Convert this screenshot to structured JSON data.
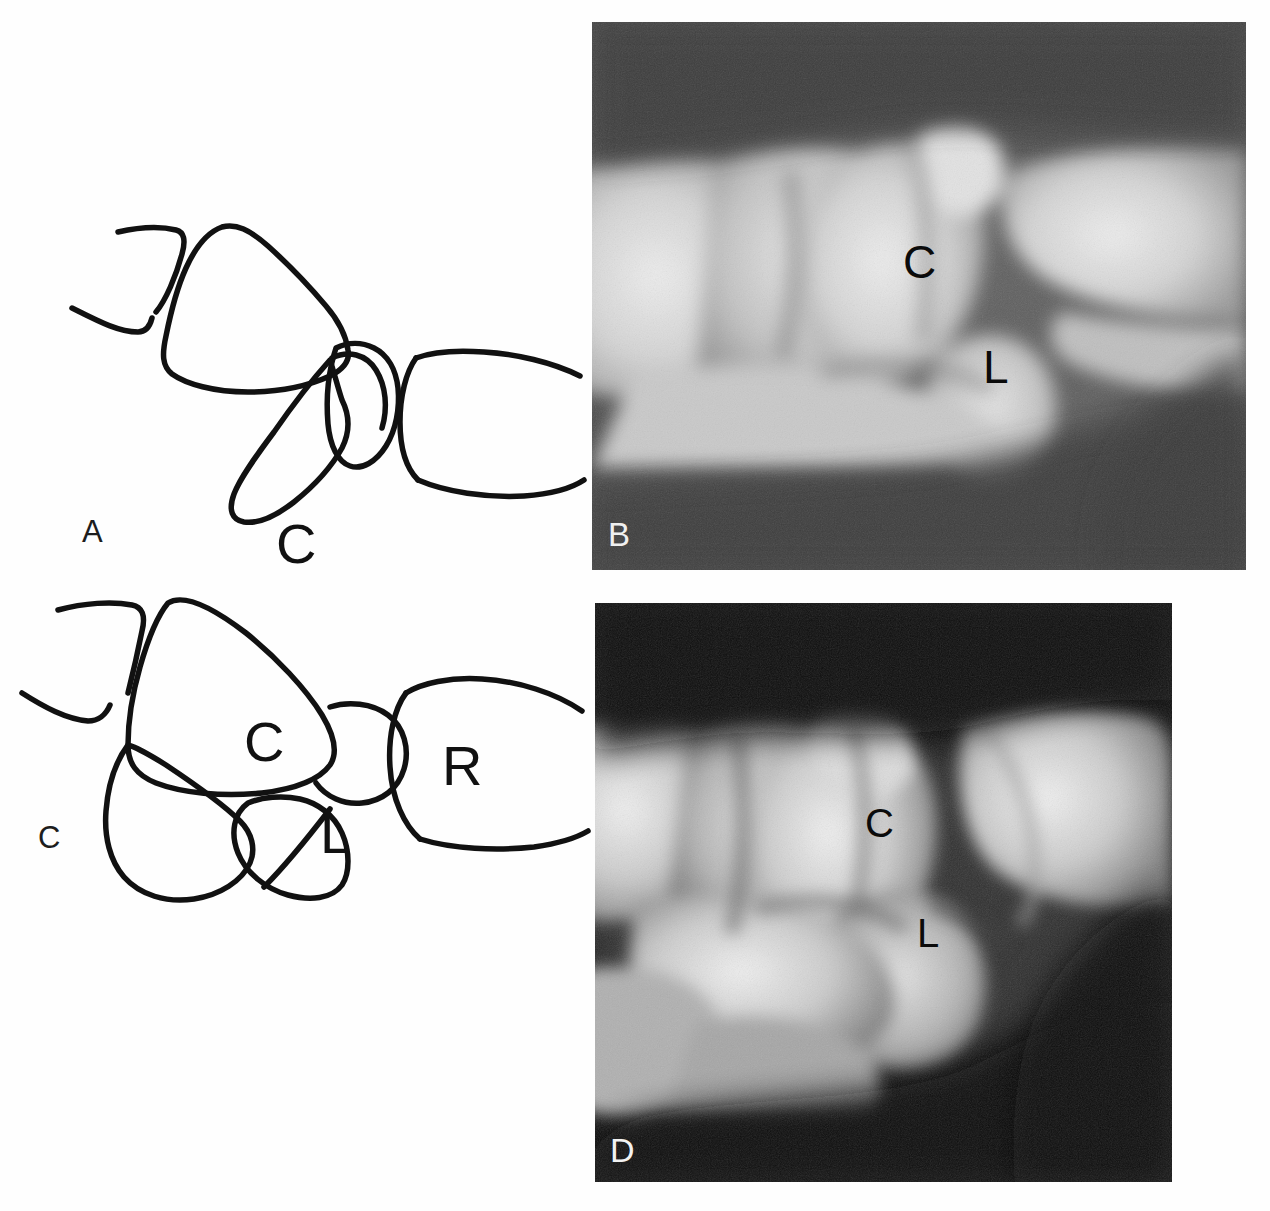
{
  "figure": {
    "background_color": "#ffffff",
    "panel_count": 4,
    "layout": "2x2 grid; left column line drawings (A, C), right column radiographs (B, D)"
  },
  "panels": [
    {
      "id": "A",
      "letter": "A",
      "type": "line-drawing",
      "letter_color": "#1d1d1d",
      "description": "Lateral line drawing of the wrist showing dorsal intercalated segment instability (DISI): lunate tilted dorsally, capitate displaced dorsally.",
      "stroke_color": "#111111",
      "bone_labels": [
        {
          "text": "C",
          "name": "capitate",
          "x": 300,
          "y": 362
        },
        {
          "text": "L",
          "name": "lunate",
          "x": 380,
          "y": 432
        },
        {
          "text": "R",
          "name": "radius",
          "x": 456,
          "y": 432
        }
      ]
    },
    {
      "id": "B",
      "letter": "B",
      "type": "radiograph",
      "letter_color": "#f0f0f0",
      "description": "Lateral radiograph of the wrist corresponding to drawing A; background mid-gray, bones bright.",
      "background_color": "#4a4a4a",
      "bone_labels": [
        {
          "text": "C",
          "name": "capitate",
          "x": 925,
          "y": 262
        },
        {
          "text": "L",
          "name": "lunate",
          "x": 1005,
          "y": 368
        }
      ]
    },
    {
      "id": "C",
      "letter": "C",
      "type": "line-drawing",
      "letter_color": "#1d1d1d",
      "description": "Lateral line drawing of the wrist showing volar intercalated segment instability (VISI): lunate tilted volarly.",
      "stroke_color": "#111111",
      "bone_labels": [
        {
          "text": "C",
          "name": "capitate",
          "x": 270,
          "y": 740
        },
        {
          "text": "L",
          "name": "lunate",
          "x": 343,
          "y": 832
        },
        {
          "text": "R",
          "name": "radius",
          "x": 468,
          "y": 762
        }
      ]
    },
    {
      "id": "D",
      "letter": "D",
      "type": "radiograph",
      "letter_color": "#f2f2f2",
      "description": "Lateral radiograph of the wrist corresponding to drawing C; darker film with high contrast bones.",
      "background_color": "#111111",
      "bone_labels": [
        {
          "text": "C",
          "name": "capitate",
          "x": 877,
          "y": 825
        },
        {
          "text": "L",
          "name": "lunate",
          "x": 930,
          "y": 935
        }
      ]
    }
  ],
  "labels": {
    "capitate": "C",
    "lunate": "L",
    "radius": "R"
  },
  "panel_letters": {
    "a": "A",
    "b": "B",
    "c": "C",
    "d": "D"
  }
}
